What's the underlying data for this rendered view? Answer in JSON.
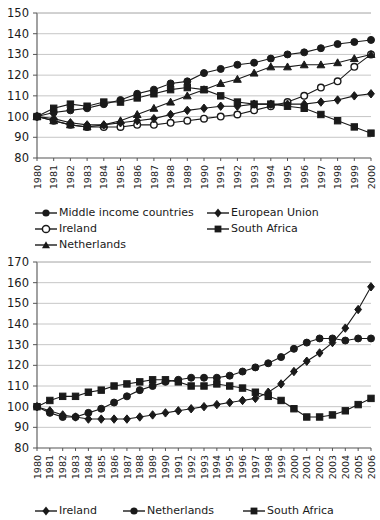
{
  "chart_data": [
    {
      "id": "chart-top",
      "type": "line",
      "title": "",
      "xlabel": "",
      "ylabel": "",
      "ylim": [
        80,
        150
      ],
      "yticks": [
        80,
        90,
        100,
        110,
        120,
        130,
        140,
        150
      ],
      "grid": true,
      "legend_position": "below",
      "x": [
        1980,
        1981,
        1982,
        1983,
        1984,
        1985,
        1986,
        1987,
        1988,
        1989,
        1990,
        1991,
        1992,
        1993,
        1994,
        1995,
        1996,
        1997,
        1998,
        1999,
        2000
      ],
      "series": [
        {
          "name": "Middle income countries",
          "marker": "circle-filled",
          "values": [
            100,
            102,
            103,
            104,
            106,
            108,
            111,
            113,
            116,
            117,
            121,
            123,
            125,
            126,
            128,
            130,
            131,
            133,
            135,
            136,
            137
          ]
        },
        {
          "name": "Ireland",
          "marker": "circle-open",
          "values": [
            100,
            98,
            96,
            95,
            95,
            95,
            96,
            96,
            97,
            98,
            99,
            100,
            101,
            103,
            105,
            107,
            110,
            114,
            117,
            124,
            130
          ]
        },
        {
          "name": "Netherlands",
          "marker": "triangle-filled",
          "values": [
            100,
            98,
            96,
            95,
            96,
            98,
            101,
            104,
            107,
            110,
            113,
            116,
            118,
            121,
            124,
            124,
            125,
            125,
            126,
            128,
            130
          ]
        },
        {
          "name": "European Union",
          "marker": "diamond-filled",
          "values": [
            100,
            99,
            97,
            96,
            96,
            97,
            98,
            99,
            101,
            103,
            104,
            105,
            105,
            106,
            106,
            106,
            106,
            107,
            108,
            110,
            111
          ]
        },
        {
          "name": "South Africa",
          "marker": "square-filled",
          "values": [
            100,
            104,
            106,
            105,
            107,
            107,
            109,
            111,
            113,
            114,
            113,
            110,
            107,
            106,
            106,
            105,
            104,
            101,
            98,
            95,
            92
          ]
        }
      ]
    },
    {
      "id": "chart-bottom",
      "type": "line",
      "title": "",
      "xlabel": "",
      "ylabel": "",
      "ylim": [
        80,
        170
      ],
      "yticks": [
        80,
        90,
        100,
        110,
        120,
        130,
        140,
        150,
        160,
        170
      ],
      "grid": true,
      "legend_position": "below",
      "x": [
        1980,
        1981,
        1982,
        1983,
        1984,
        1985,
        1986,
        1987,
        1988,
        1989,
        1990,
        1991,
        1992,
        1993,
        1994,
        1995,
        1996,
        1997,
        1998,
        1999,
        2000,
        2001,
        2002,
        2003,
        2004,
        2005,
        2006
      ],
      "series": [
        {
          "name": "Ireland",
          "marker": "diamond-filled",
          "values": [
            100,
            98,
            96,
            95,
            94,
            94,
            94,
            94,
            95,
            96,
            97,
            98,
            99,
            100,
            101,
            102,
            103,
            104,
            107,
            111,
            117,
            122,
            126,
            131,
            138,
            147,
            158
          ]
        },
        {
          "name": "Netherlands",
          "marker": "circle-filled",
          "values": [
            100,
            97,
            95,
            95,
            97,
            99,
            102,
            105,
            108,
            110,
            112,
            113,
            114,
            114,
            114,
            115,
            117,
            119,
            121,
            124,
            128,
            131,
            133,
            133,
            132,
            133,
            133
          ]
        },
        {
          "name": "South Africa",
          "marker": "square-filled",
          "values": [
            100,
            103,
            105,
            105,
            107,
            108,
            110,
            111,
            112,
            113,
            113,
            112,
            110,
            110,
            111,
            110,
            109,
            107,
            105,
            103,
            99,
            95,
            95,
            96,
            98,
            101,
            104
          ]
        }
      ]
    }
  ],
  "legends": {
    "top": [
      {
        "label": "Middle income countries",
        "marker": "circle-filled"
      },
      {
        "label": "European Union",
        "marker": "diamond-filled"
      },
      {
        "label": "Ireland",
        "marker": "circle-open"
      },
      {
        "label": "South Africa",
        "marker": "square-filled"
      },
      {
        "label": "Netherlands",
        "marker": "triangle-filled"
      }
    ],
    "bottom": [
      {
        "label": "Ireland",
        "marker": "diamond-filled"
      },
      {
        "label": "Netherlands",
        "marker": "circle-filled"
      },
      {
        "label": "South Africa",
        "marker": "square-filled"
      }
    ]
  }
}
